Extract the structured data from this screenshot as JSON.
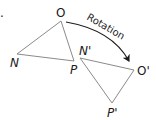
{
  "diagram": {
    "marker": ".",
    "arrow_label": "Rotation",
    "line_color": "#8a8a8a",
    "arrow_color": "#1a1a1a",
    "original_triangle": {
      "vertices": {
        "O": {
          "label": "O",
          "x": 61,
          "y": 21
        },
        "N": {
          "label": "N",
          "x": 17,
          "y": 54
        },
        "P": {
          "label": "P",
          "x": 74,
          "y": 61
        }
      }
    },
    "image_triangle": {
      "vertices": {
        "N_prime": {
          "label": "N'",
          "x": 80,
          "y": 58
        },
        "O_prime": {
          "label": "O'",
          "x": 134,
          "y": 70
        },
        "P_prime": {
          "label": "P'",
          "x": 112,
          "y": 103
        }
      }
    }
  }
}
